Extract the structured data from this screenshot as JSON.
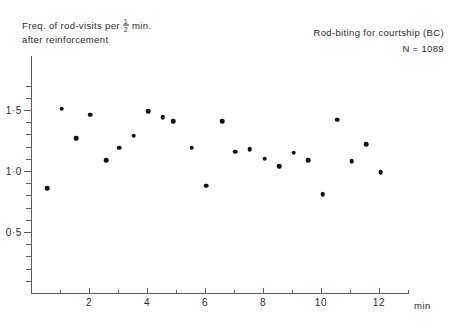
{
  "figure": {
    "ylabel_line1_prefix": "Freq. of rod-visits per",
    "ylabel_fraction_numerator": "1",
    "ylabel_fraction_denominator": "2",
    "ylabel_line1_suffix": "min.",
    "ylabel_line2": "after  reinforcement",
    "annotation_title": "Rod-biting for courtship (BC)",
    "annotation_n": "N = 1089",
    "x_unit": "min",
    "point_color": "#111111",
    "axis_color": "#5c5c5c"
  },
  "chart_data": {
    "type": "scatter",
    "title": "Rod-biting for courtship (BC)",
    "subtitle": "N = 1089",
    "xlabel": "min",
    "ylabel": "Freq. of rod-visits per 1/2 min. after reinforcement",
    "xlim": [
      0,
      13
    ],
    "ylim": [
      0,
      1.75
    ],
    "grid": false,
    "legend": null,
    "x_ticks_major": [
      2,
      4,
      6,
      8,
      10,
      12
    ],
    "x_tick_labels": [
      "2",
      "4",
      "6",
      "8",
      "10",
      "12"
    ],
    "x_ticks_all": [
      1,
      2,
      3,
      4,
      5,
      6,
      7,
      8,
      9,
      10,
      11,
      12,
      13
    ],
    "y_ticks_major": [
      0.5,
      1.0,
      1.5
    ],
    "y_tick_labels": [
      "0·5",
      "1·0",
      "1·5"
    ],
    "y_ticks_minor": [
      0.1,
      0.2,
      0.3,
      0.4,
      0.6,
      0.7,
      0.8,
      0.9,
      1.1,
      1.2,
      1.3,
      1.4,
      1.6,
      1.7
    ],
    "points": [
      {
        "x": 0.55,
        "y": 0.86
      },
      {
        "x": 1.05,
        "y": 1.51
      },
      {
        "x": 1.55,
        "y": 1.27
      },
      {
        "x": 2.05,
        "y": 1.46
      },
      {
        "x": 2.6,
        "y": 1.09
      },
      {
        "x": 3.05,
        "y": 1.19
      },
      {
        "x": 3.55,
        "y": 1.29
      },
      {
        "x": 4.05,
        "y": 1.49
      },
      {
        "x": 4.55,
        "y": 1.44
      },
      {
        "x": 4.9,
        "y": 1.41
      },
      {
        "x": 5.55,
        "y": 1.19
      },
      {
        "x": 6.05,
        "y": 0.88
      },
      {
        "x": 6.6,
        "y": 1.41
      },
      {
        "x": 7.05,
        "y": 1.16
      },
      {
        "x": 7.55,
        "y": 1.18
      },
      {
        "x": 8.05,
        "y": 1.1
      },
      {
        "x": 8.55,
        "y": 1.04
      },
      {
        "x": 9.05,
        "y": 1.15
      },
      {
        "x": 9.55,
        "y": 1.09
      },
      {
        "x": 10.05,
        "y": 0.81
      },
      {
        "x": 10.55,
        "y": 1.42
      },
      {
        "x": 11.05,
        "y": 1.08
      },
      {
        "x": 11.55,
        "y": 1.22
      },
      {
        "x": 12.05,
        "y": 0.99
      }
    ]
  }
}
